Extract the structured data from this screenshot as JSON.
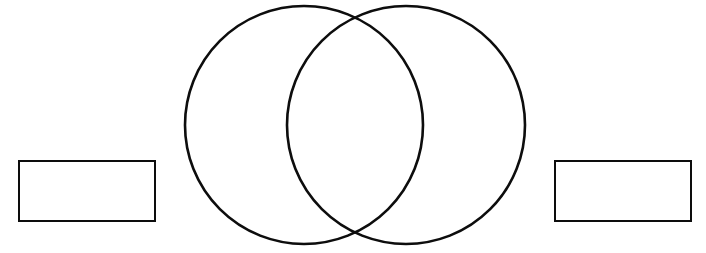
{
  "document": {
    "type": "venn-diagram-worksheet",
    "title": "",
    "background_color": "#ffffff",
    "stroke_color": "#0d0d0d",
    "width": 706,
    "height": 253
  },
  "diagram": {
    "name": "two-circle-venn-diagram",
    "circles": [
      {
        "id": "left-circle",
        "label": "",
        "center_x": 304,
        "center_y": 125,
        "radius": 119,
        "stroke": "#0d0d0d",
        "stroke_width": 2.6,
        "fill": "none"
      },
      {
        "id": "right-circle",
        "label": "",
        "center_x": 406,
        "center_y": 125,
        "radius": 119,
        "stroke": "#0d0d0d",
        "stroke_width": 2.6,
        "fill": "none"
      }
    ],
    "intersection_points": [
      {
        "x": 355,
        "y": 18
      },
      {
        "x": 355,
        "y": 232
      }
    ],
    "regions": {
      "left_only_text": "",
      "overlap_text": "",
      "right_only_text": ""
    }
  },
  "label_boxes": [
    {
      "id": "left-label-box",
      "text": "",
      "placeholder": "",
      "x": 18,
      "y": 160,
      "width": 138,
      "height": 62
    },
    {
      "id": "right-label-box",
      "text": "",
      "placeholder": "",
      "x": 554,
      "y": 160,
      "width": 138,
      "height": 62
    }
  ]
}
